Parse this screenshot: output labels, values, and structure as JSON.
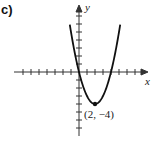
{
  "panel_label": "c)",
  "chart_data": {
    "type": "line",
    "title": "",
    "xlabel": "x",
    "ylabel": "y",
    "function": "y = x^2 - 4x",
    "x": [
      -1.1,
      -0.5,
      0,
      1,
      2,
      3,
      4,
      4.5,
      5.1
    ],
    "values": [
      5.61,
      2.25,
      0,
      -3,
      -4,
      -3,
      0,
      2.25,
      5.61
    ],
    "annotations": [
      {
        "x": 2,
        "y": -4,
        "text": "(2, −4)",
        "marker": "point"
      }
    ],
    "xlim": [
      -7,
      8
    ],
    "ylim": [
      -8,
      8
    ],
    "grid": false,
    "tick_spacing": 1
  },
  "annotation_text": "(2, −4)",
  "axis_labels": {
    "x": "x",
    "y": "y"
  }
}
